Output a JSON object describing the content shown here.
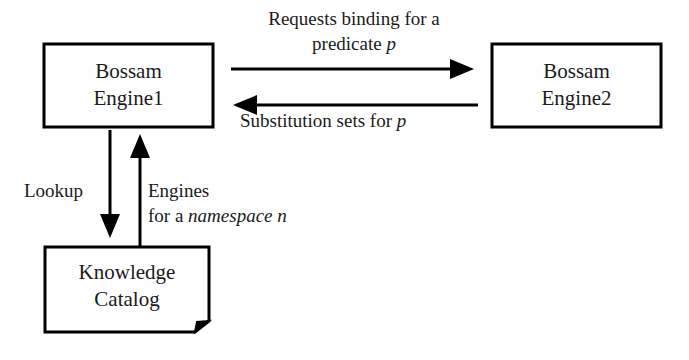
{
  "diagram": {
    "background_color": "#ffffff",
    "stroke_color": "#000000",
    "text_color": "#1a1a1a",
    "nodes": [
      {
        "id": "engine1",
        "shape": "rectangle",
        "line1": "Bossam",
        "line2": "Engine1"
      },
      {
        "id": "engine2",
        "shape": "rectangle",
        "line1": "Bossam",
        "line2": "Engine2"
      },
      {
        "id": "catalog",
        "shape": "document",
        "line1": "Knowledge",
        "line2": "Catalog"
      }
    ],
    "edges": [
      {
        "id": "request-edge",
        "from": "engine1",
        "to": "engine2",
        "direction": "right",
        "label_line1": "Requests binding for a",
        "label_line2_plain": "predicate ",
        "label_line2_italic": "p"
      },
      {
        "id": "substitution-edge",
        "from": "engine2",
        "to": "engine1",
        "direction": "left",
        "label_plain": "Substitution sets for ",
        "label_italic": "p"
      },
      {
        "id": "lookup-edge",
        "from": "engine1",
        "to": "catalog",
        "direction": "down",
        "label": "Lookup"
      },
      {
        "id": "engines-edge",
        "from": "catalog",
        "to": "engine1",
        "direction": "up",
        "label_line1": "Engines",
        "label_line2_plain": "for a ",
        "label_line2_italic": "namespace n"
      }
    ]
  }
}
